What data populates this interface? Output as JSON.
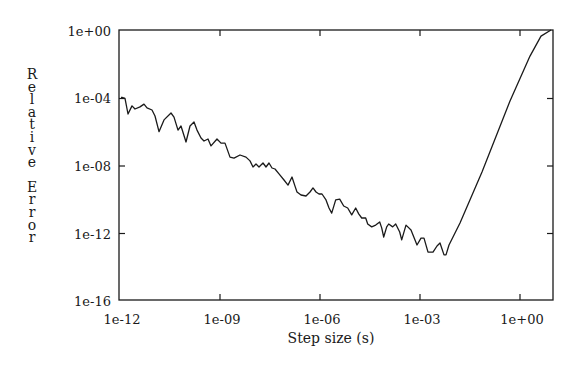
{
  "chart_data": {
    "type": "line",
    "title": "",
    "xlabel": "Step size (s)",
    "ylabel": "Relative Error",
    "xscale": "log",
    "yscale": "log",
    "xlim": [
      1e-12,
      10.0
    ],
    "ylim": [
      1e-16,
      1.0
    ],
    "x_ticks": [
      "1e-12",
      "1e-09",
      "1e-06",
      "1e-03",
      "1e+00"
    ],
    "x_tick_values": [
      -12,
      -9,
      -6,
      -3,
      0
    ],
    "y_ticks": [
      "1e+00",
      "1e-04",
      "1e-08",
      "1e-12",
      "1e-16"
    ],
    "y_tick_values": [
      0,
      -4,
      -8,
      -12,
      -16
    ],
    "grid": false,
    "legend": null,
    "series": [
      {
        "name": "Relative Error",
        "color": "#1a1a1a",
        "log10_points": [
          [
            -11.94,
            -3.93
          ],
          [
            -11.97,
            -3.93
          ],
          [
            -11.85,
            -3.99
          ],
          [
            -11.76,
            -4.92
          ],
          [
            -11.64,
            -4.44
          ],
          [
            -11.55,
            -4.62
          ],
          [
            -11.4,
            -4.5
          ],
          [
            -11.28,
            -4.33
          ],
          [
            -11.19,
            -4.56
          ],
          [
            -11.04,
            -4.68
          ],
          [
            -10.95,
            -5.04
          ],
          [
            -10.83,
            -5.97
          ],
          [
            -10.68,
            -5.27
          ],
          [
            -10.47,
            -4.86
          ],
          [
            -10.38,
            -5.1
          ],
          [
            -10.26,
            -5.87
          ],
          [
            -10.17,
            -5.63
          ],
          [
            -10.02,
            -6.58
          ],
          [
            -9.9,
            -5.63
          ],
          [
            -9.78,
            -5.39
          ],
          [
            -9.69,
            -5.87
          ],
          [
            -9.57,
            -6.34
          ],
          [
            -9.48,
            -6.52
          ],
          [
            -9.36,
            -6.4
          ],
          [
            -9.27,
            -6.81
          ],
          [
            -9.09,
            -6.4
          ],
          [
            -8.97,
            -6.64
          ],
          [
            -8.85,
            -6.64
          ],
          [
            -8.7,
            -7.47
          ],
          [
            -8.58,
            -7.53
          ],
          [
            -8.4,
            -7.35
          ],
          [
            -8.22,
            -7.47
          ],
          [
            -8.1,
            -7.7
          ],
          [
            -8.01,
            -8.06
          ],
          [
            -7.92,
            -7.88
          ],
          [
            -7.83,
            -8.06
          ],
          [
            -7.71,
            -7.82
          ],
          [
            -7.62,
            -8.06
          ],
          [
            -7.53,
            -7.82
          ],
          [
            -7.44,
            -8.12
          ],
          [
            -7.35,
            -8.18
          ],
          [
            -7.23,
            -8.47
          ],
          [
            -7.08,
            -8.83
          ],
          [
            -6.96,
            -9.13
          ],
          [
            -6.84,
            -8.65
          ],
          [
            -6.75,
            -9.19
          ],
          [
            -6.69,
            -9.54
          ],
          [
            -6.57,
            -9.72
          ],
          [
            -6.42,
            -9.78
          ],
          [
            -6.3,
            -9.54
          ],
          [
            -6.21,
            -9.3
          ],
          [
            -6.12,
            -9.54
          ],
          [
            -6.03,
            -9.66
          ],
          [
            -5.94,
            -9.66
          ],
          [
            -5.82,
            -10.01
          ],
          [
            -5.73,
            -10.49
          ],
          [
            -5.65,
            -10.79
          ],
          [
            -5.53,
            -10.01
          ],
          [
            -5.41,
            -9.96
          ],
          [
            -5.29,
            -10.37
          ],
          [
            -5.17,
            -10.49
          ],
          [
            -5.05,
            -10.9
          ],
          [
            -4.93,
            -10.49
          ],
          [
            -4.84,
            -10.84
          ],
          [
            -4.75,
            -11.08
          ],
          [
            -4.63,
            -11.08
          ],
          [
            -4.57,
            -11.44
          ],
          [
            -4.45,
            -11.61
          ],
          [
            -4.33,
            -11.5
          ],
          [
            -4.21,
            -11.32
          ],
          [
            -4.15,
            -11.67
          ],
          [
            -4.09,
            -12.21
          ],
          [
            -4.0,
            -11.61
          ],
          [
            -3.94,
            -11.44
          ],
          [
            -3.82,
            -11.61
          ],
          [
            -3.73,
            -11.44
          ],
          [
            -3.61,
            -11.91
          ],
          [
            -3.55,
            -12.38
          ],
          [
            -3.42,
            -11.5
          ],
          [
            -3.27,
            -11.79
          ],
          [
            -3.09,
            -12.68
          ],
          [
            -2.97,
            -12.27
          ],
          [
            -2.88,
            -12.27
          ],
          [
            -2.76,
            -13.1
          ],
          [
            -2.61,
            -13.1
          ],
          [
            -2.49,
            -12.74
          ],
          [
            -2.4,
            -12.56
          ],
          [
            -2.28,
            -13.27
          ],
          [
            -2.22,
            -13.27
          ],
          [
            -2.13,
            -12.68
          ],
          [
            -1.8,
            -11.38
          ],
          [
            -1.14,
            -8.36
          ],
          [
            -0.3,
            -4.15
          ],
          [
            0.3,
            -1.49
          ],
          [
            0.63,
            -0.3
          ],
          [
            0.93,
            0.12
          ]
        ]
      }
    ]
  },
  "axis": {
    "x_ticks": [
      "1e-12",
      "1e-09",
      "1e-06",
      "1e-03",
      "1e+00"
    ],
    "y_ticks": [
      "1e+00",
      "1e-04",
      "1e-08",
      "1e-12",
      "1e-16"
    ],
    "xlabel": "Step size (s)",
    "ylabel_letters": [
      "R",
      "e",
      "l",
      "a",
      "t",
      "i",
      "v",
      "e",
      "",
      "E",
      "r",
      "r",
      "o",
      "r"
    ]
  }
}
